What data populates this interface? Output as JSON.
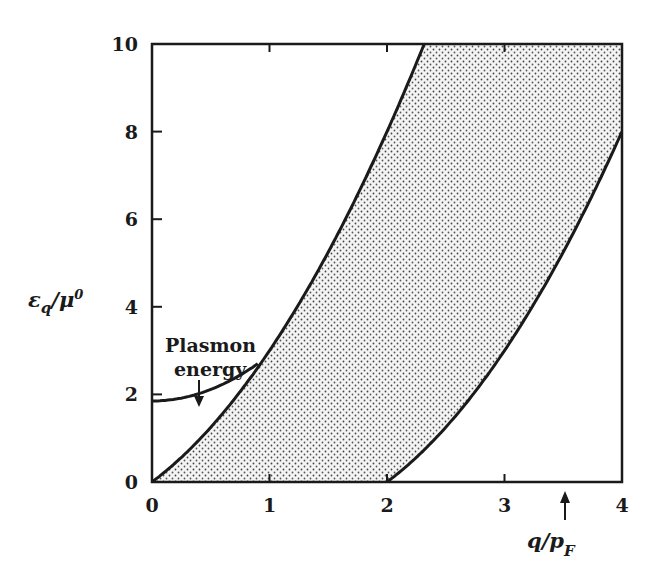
{
  "chart_data": {
    "type": "area",
    "title": "",
    "xlabel": "q/p_F",
    "ylabel": "ε_q/μ⁰",
    "xlim": [
      0,
      4
    ],
    "ylim": [
      0,
      10
    ],
    "xticks": [
      "0",
      "1",
      "2",
      "3",
      "4"
    ],
    "yticks": [
      "0",
      "2",
      "4",
      "6",
      "8",
      "10"
    ],
    "grid": false,
    "legend": null,
    "series": [
      {
        "name": "Continuum upper edge (q²+2q)",
        "x": [
          0,
          0.5,
          1.0,
          1.5,
          2.0,
          2.26
        ],
        "y": [
          0,
          1.25,
          3.0,
          5.25,
          8.0,
          10.0
        ]
      },
      {
        "name": "Continuum lower edge (q²−2q)",
        "x": [
          2.0,
          2.5,
          3.0,
          3.5,
          4.0
        ],
        "y": [
          0,
          1.25,
          3.0,
          5.25,
          8.0
        ]
      },
      {
        "name": "Plasmon energy",
        "x": [
          0,
          0.25,
          0.5,
          0.75,
          0.9
        ],
        "y": [
          1.85,
          1.95,
          2.15,
          2.45,
          2.7
        ]
      }
    ],
    "shaded_region": "particle-hole continuum between q²−2q and q²+2q",
    "annotations": [
      {
        "text": "Plasmon energy",
        "arrow_to": {
          "x": 0.4,
          "y": 2.0
        }
      },
      {
        "text": "↑",
        "at_x": 3.5,
        "note": "arrow below x-axis near q/p_F label"
      }
    ]
  },
  "labels": {
    "y_axis_main": "ε",
    "y_axis_sub": "q",
    "y_axis_rest": "/μ",
    "y_axis_sup": "0",
    "x_axis_main": "q/p",
    "x_axis_sub": "F",
    "plasmon_line1": "Plasmon",
    "plasmon_line2": "energy"
  },
  "xtick_labels": [
    "0",
    "1",
    "2",
    "3",
    "4"
  ],
  "ytick_labels": [
    "0",
    "2",
    "4",
    "6",
    "8",
    "10"
  ]
}
